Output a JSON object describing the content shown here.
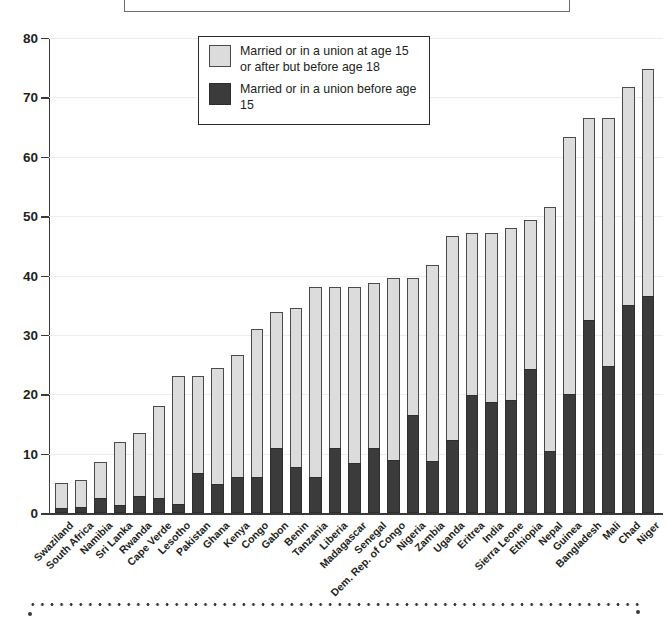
{
  "top_box": {
    "caption_text": ""
  },
  "legend": {
    "items": [
      {
        "id": "light",
        "label": "Married or in a union at age 15 or after but before age 18",
        "color": "#dcdcdc",
        "swatch_name": "legend-swatch-light"
      },
      {
        "id": "dark",
        "label": "Married or in a union before age 15",
        "color": "#3b3b3b",
        "swatch_name": "legend-swatch-dark"
      }
    ]
  },
  "chart_data": {
    "type": "bar",
    "stacked": true,
    "title": "",
    "xlabel": "",
    "ylabel": "",
    "ylim": [
      0,
      80
    ],
    "yticks": [
      0,
      10,
      20,
      30,
      40,
      50,
      60,
      70,
      80
    ],
    "grid": true,
    "legend_position": "top-center",
    "categories": [
      "Swaziland",
      "South Africa",
      "Namibia",
      "Sri Lanka",
      "Rwanda",
      "Cape Verde",
      "Lesotho",
      "Pakistan",
      "Ghana",
      "Kenya",
      "Congo",
      "Gabon",
      "Benin",
      "Tanzania",
      "Liberia",
      "Madagascar",
      "Senegal",
      "Dem. Rep. of Congo",
      "Nigeria",
      "Zambia",
      "Uganda",
      "Eritrea",
      "India",
      "Sierra Leone",
      "Ethiopia",
      "Nepal",
      "Guinea",
      "Bangladesh",
      "Mali",
      "Chad",
      "Niger"
    ],
    "series": [
      {
        "name": "Married or in a union before age 15",
        "color": "#3b3b3b",
        "values": [
          0.8,
          1.0,
          2.6,
          1.3,
          2.8,
          2.5,
          1.5,
          6.8,
          4.9,
          6.0,
          6.0,
          11.0,
          7.8,
          6.0,
          11.0,
          8.5,
          11.0,
          9.0,
          16.5,
          8.7,
          12.3,
          19.9,
          18.7,
          19.0,
          24.2,
          10.5,
          20.1,
          32.5,
          24.8,
          35.1,
          36.5
        ]
      },
      {
        "name": "Married or in a union at age 15 or after but before age 18",
        "color": "#dcdcdc",
        "values": [
          4.2,
          4.5,
          6.0,
          10.7,
          10.7,
          15.5,
          21.5,
          16.2,
          19.6,
          20.6,
          25.0,
          22.9,
          26.7,
          32.0,
          27.0,
          29.6,
          27.8,
          30.6,
          23.1,
          33.1,
          34.4,
          27.3,
          28.5,
          29.0,
          25.2,
          41.0,
          43.3,
          34.0,
          41.8,
          36.6,
          38.3
        ]
      }
    ],
    "totals": [
      5.0,
      5.5,
      8.6,
      12.0,
      13.5,
      18.0,
      23.0,
      23.0,
      24.5,
      26.6,
      31.0,
      33.9,
      34.5,
      38.0,
      38.0,
      38.1,
      38.8,
      39.6,
      39.6,
      41.8,
      46.7,
      47.2,
      47.2,
      48.0,
      49.4,
      51.5,
      63.4,
      66.5,
      66.6,
      71.7,
      74.8
    ]
  }
}
